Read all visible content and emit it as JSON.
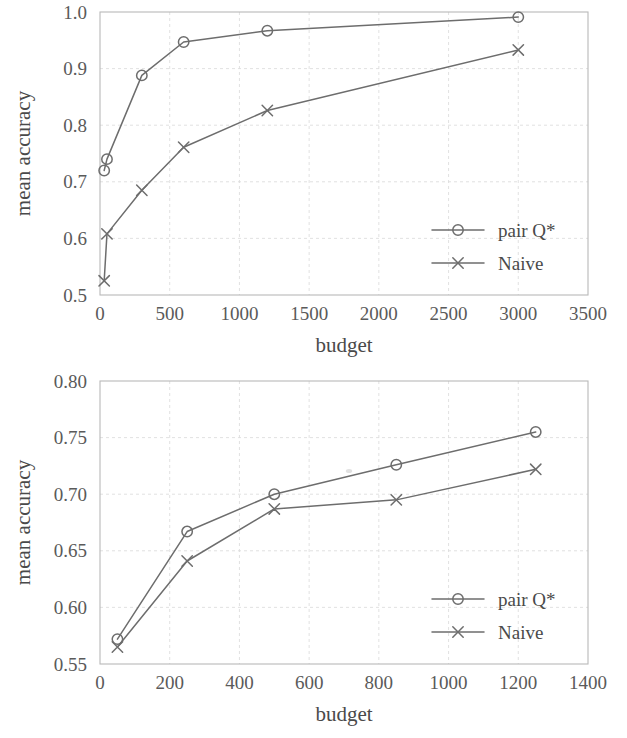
{
  "figures": [
    {
      "id": "top",
      "axis": {
        "xlabel": "budget",
        "ylabel": "mean accuracy",
        "xticks": [
          "0",
          "500",
          "1000",
          "1500",
          "2000",
          "2500",
          "3000",
          "3500"
        ],
        "yticks": [
          "0.5",
          "0.6",
          "0.7",
          "0.8",
          "0.9",
          "1.0"
        ]
      },
      "legend": {
        "entries": [
          {
            "label": "pair Q*",
            "marker": "circle-marker-icon"
          },
          {
            "label": "Naive",
            "marker": "cross-marker-icon"
          }
        ]
      }
    },
    {
      "id": "bottom",
      "axis": {
        "xlabel": "budget",
        "ylabel": "mean accuracy",
        "xticks": [
          "0",
          "200",
          "400",
          "600",
          "800",
          "1000",
          "1200",
          "1400"
        ],
        "yticks": [
          "0.55",
          "0.60",
          "0.65",
          "0.70",
          "0.75",
          "0.80"
        ]
      },
      "legend": {
        "entries": [
          {
            "label": "pair Q*",
            "marker": "circle-marker-icon"
          },
          {
            "label": "Naive",
            "marker": "cross-marker-icon"
          }
        ]
      }
    }
  ],
  "chart_data": [
    {
      "type": "line",
      "title": "",
      "xlabel": "budget",
      "ylabel": "mean accuracy",
      "xlim": [
        0,
        3500
      ],
      "ylim": [
        0.5,
        1.0
      ],
      "xticks": [
        0,
        500,
        1000,
        1500,
        2000,
        2500,
        3000,
        3500
      ],
      "yticks": [
        0.5,
        0.6,
        0.7,
        0.8,
        0.9,
        1.0
      ],
      "grid": true,
      "legend_position": "lower-right",
      "series": [
        {
          "name": "pair Q*",
          "marker": "circle",
          "color": "#6d6d6d",
          "x": [
            30,
            50,
            300,
            600,
            1200,
            3000
          ],
          "y": [
            0.72,
            0.74,
            0.888,
            0.947,
            0.967,
            0.991
          ]
        },
        {
          "name": "Naive",
          "marker": "cross",
          "color": "#6d6d6d",
          "x": [
            30,
            50,
            300,
            600,
            1200,
            3000
          ],
          "y": [
            0.525,
            0.608,
            0.685,
            0.761,
            0.826,
            0.933
          ]
        }
      ]
    },
    {
      "type": "line",
      "title": "",
      "xlabel": "budget",
      "ylabel": "mean accuracy",
      "xlim": [
        0,
        1400
      ],
      "ylim": [
        0.55,
        0.8
      ],
      "xticks": [
        0,
        200,
        400,
        600,
        800,
        1000,
        1200,
        1400
      ],
      "yticks": [
        0.55,
        0.6,
        0.65,
        0.7,
        0.75,
        0.8
      ],
      "grid": true,
      "legend_position": "lower-right",
      "series": [
        {
          "name": "pair Q*",
          "marker": "circle",
          "color": "#6d6d6d",
          "x": [
            50,
            250,
            500,
            850,
            1250
          ],
          "y": [
            0.572,
            0.667,
            0.7,
            0.726,
            0.755
          ]
        },
        {
          "name": "Naive",
          "marker": "cross",
          "color": "#6d6d6d",
          "x": [
            50,
            250,
            500,
            850,
            1250
          ],
          "y": [
            0.565,
            0.641,
            0.687,
            0.695,
            0.722
          ]
        }
      ]
    }
  ]
}
